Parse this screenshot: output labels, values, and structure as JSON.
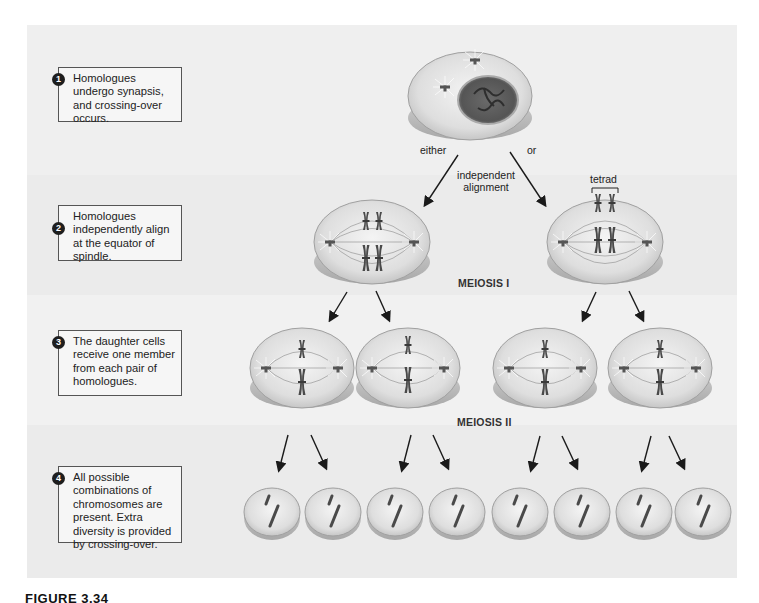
{
  "figure": {
    "caption": "FIGURE 3.34",
    "caption_rest": "Independent assortment",
    "colors": {
      "panel_bg": "#ebebeb",
      "cell_fill": "#d9d9d9",
      "cell_edge": "#9a9a9a",
      "chromosome": "#4a4a4a",
      "arrow": "#1a1a1a"
    }
  },
  "steps": [
    {
      "number": "1",
      "text": "Homologues undergo synapsis, and crossing-over occurs."
    },
    {
      "number": "2",
      "text": "Homologues independently align at the equator of spindle."
    },
    {
      "number": "3",
      "text": "The daughter cells receive one member from each pair of homologues."
    },
    {
      "number": "4",
      "text": "All possible combinations of chromosomes are present. Extra diversity is provided by crossing-over."
    }
  ],
  "labels": {
    "either": "either",
    "or": "or",
    "independent_alignment_line1": "independent",
    "independent_alignment_line2": "alignment",
    "tetrad": "tetrad",
    "meiosis_1": "MEIOSIS I",
    "meiosis_2": "MEIOSIS II"
  },
  "cells": {
    "prophase": {
      "count": 1
    },
    "metaphase_1": {
      "count": 2
    },
    "metaphase_2": {
      "count": 4
    },
    "daughter": {
      "count": 8
    }
  }
}
